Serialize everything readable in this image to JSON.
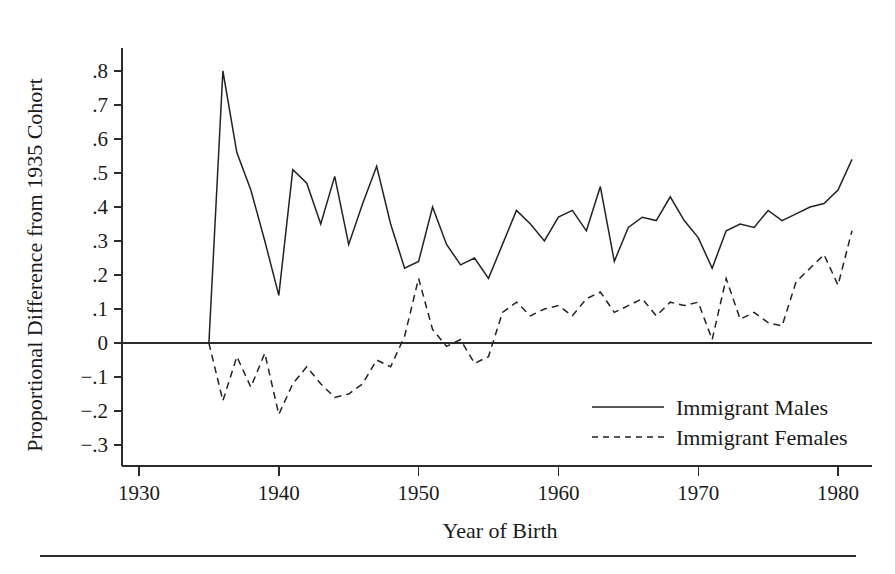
{
  "chart_data": {
    "type": "line",
    "title": "",
    "xlabel": "Year of Birth",
    "ylabel": "Proportional Difference from 1935 Cohort",
    "xlim": [
      1928,
      1982
    ],
    "ylim": [
      -0.33,
      0.85
    ],
    "grid": false,
    "legend_position": "bottom-right",
    "x_tick_labels": [
      "1930",
      "1940",
      "1950",
      "1960",
      "1970",
      "1980"
    ],
    "x_ticks": [
      1930,
      1940,
      1950,
      1960,
      1970,
      1980
    ],
    "y_tick_labels": [
      ".8",
      ".7",
      ".6",
      ".5",
      ".4",
      ".3",
      ".2",
      ".1",
      "0",
      "−.1",
      "−.2",
      "−.3"
    ],
    "y_ticks": [
      0.8,
      0.7,
      0.6,
      0.5,
      0.4,
      0.3,
      0.2,
      0.1,
      0,
      -0.1,
      -0.2,
      -0.3
    ],
    "zero_reference_line": 0,
    "x": [
      1935,
      1936,
      1937,
      1938,
      1939,
      1940,
      1941,
      1942,
      1943,
      1944,
      1945,
      1946,
      1947,
      1948,
      1949,
      1950,
      1951,
      1952,
      1953,
      1954,
      1955,
      1956,
      1957,
      1958,
      1959,
      1960,
      1961,
      1962,
      1963,
      1964,
      1965,
      1966,
      1967,
      1968,
      1969,
      1970,
      1971,
      1972,
      1973,
      1974,
      1975,
      1976,
      1977,
      1978,
      1979,
      1980,
      1981
    ],
    "series": [
      {
        "name": "Immigrant Males",
        "style": "solid",
        "values": [
          0.0,
          0.8,
          0.56,
          0.45,
          0.3,
          0.14,
          0.51,
          0.47,
          0.35,
          0.49,
          0.29,
          0.41,
          0.52,
          0.35,
          0.22,
          0.24,
          0.4,
          0.29,
          0.23,
          0.25,
          0.19,
          0.29,
          0.39,
          0.35,
          0.3,
          0.37,
          0.39,
          0.33,
          0.46,
          0.24,
          0.34,
          0.37,
          0.36,
          0.43,
          0.36,
          0.31,
          0.22,
          0.33,
          0.35,
          0.34,
          0.39,
          0.36,
          0.38,
          0.4,
          0.41,
          0.45,
          0.54
        ]
      },
      {
        "name": "Immigrant Females",
        "style": "dashed",
        "values": [
          0.0,
          -0.17,
          -0.04,
          -0.13,
          -0.03,
          -0.21,
          -0.12,
          -0.07,
          -0.12,
          -0.16,
          -0.15,
          -0.12,
          -0.05,
          -0.07,
          0.02,
          0.19,
          0.04,
          -0.01,
          0.01,
          -0.06,
          -0.04,
          0.09,
          0.12,
          0.08,
          0.1,
          0.11,
          0.08,
          0.13,
          0.15,
          0.09,
          0.11,
          0.13,
          0.08,
          0.12,
          0.11,
          0.12,
          0.01,
          0.19,
          0.07,
          0.09,
          0.06,
          0.05,
          0.18,
          0.22,
          0.26,
          0.17,
          0.33
        ]
      }
    ]
  },
  "legend": {
    "entries": [
      {
        "label": "Immigrant Males",
        "style": "solid"
      },
      {
        "label": "Immigrant Females",
        "style": "dashed"
      }
    ]
  },
  "axes": {
    "y_title": "Proportional Difference from 1935 Cohort",
    "x_title": "Year of Birth"
  }
}
